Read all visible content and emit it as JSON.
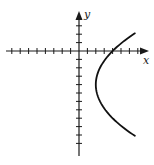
{
  "chart_data": {
    "type": "line",
    "title": "",
    "xlabel": "x",
    "ylabel": "y",
    "xlim": [
      -8,
      8
    ],
    "ylim": [
      -12,
      4
    ],
    "grid": false,
    "legend": null,
    "axis_ticks": {
      "x_ticks_left": 8,
      "x_ticks_right": 7,
      "y_ticks_up": 3,
      "y_ticks_down": 11,
      "tick_labels": false
    },
    "series": [
      {
        "name": "sideways parabola",
        "equation": "x = (y + 4)^2 / 8 + 2",
        "vertex": [
          2,
          -4
        ],
        "x_intercept": [
          4,
          0
        ],
        "y_range": [
          -10.1,
          2.1
        ],
        "points": [
          {
            "x": 6.6,
            "y": 2.1
          },
          {
            "x": 4.0,
            "y": 0
          },
          {
            "x": 2.5,
            "y": -2
          },
          {
            "x": 2.0,
            "y": -4
          },
          {
            "x": 2.5,
            "y": -6
          },
          {
            "x": 4.0,
            "y": -8
          },
          {
            "x": 6.65,
            "y": -10.1
          }
        ]
      }
    ]
  },
  "labels": {
    "x_axis": "x",
    "y_axis": "y"
  },
  "colors": {
    "axis": "#1a1a1a",
    "curve": "#111111",
    "background": "#ffffff"
  }
}
